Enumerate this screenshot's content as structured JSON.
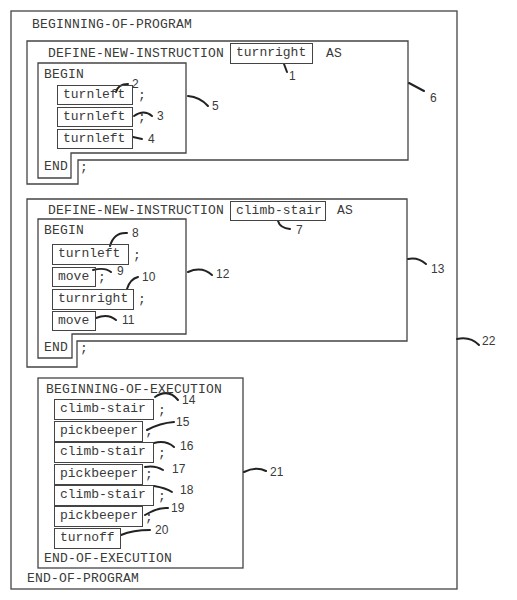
{
  "program": {
    "begin_label": "BEGINNING-OF-PROGRAM",
    "end_label": "END-OF-PROGRAM",
    "ref": "22"
  },
  "instructions": [
    {
      "define_label": "DEFINE-NEW-INSTRUCTION",
      "name": "turnright",
      "as_label": "AS",
      "name_ref": "1",
      "block_ref": "6",
      "body_ref": "5",
      "begin_label": "BEGIN",
      "end_label": "END",
      "end_semicolon": ";",
      "steps": [
        {
          "command": "turnleft",
          "semicolon": ";",
          "ref": "2"
        },
        {
          "command": "turnleft",
          "semicolon": ";",
          "ref": "3"
        },
        {
          "command": "turnleft",
          "semicolon": "",
          "ref": "4"
        }
      ]
    },
    {
      "define_label": "DEFINE-NEW-INSTRUCTION",
      "name": "climb-stair",
      "as_label": "AS",
      "name_ref": "7",
      "block_ref": "13",
      "body_ref": "12",
      "begin_label": "BEGIN",
      "end_label": "END",
      "end_semicolon": ";",
      "steps": [
        {
          "command": "turnleft",
          "semicolon": ";",
          "ref": "8"
        },
        {
          "command": "move",
          "semicolon": ";",
          "ref": "9"
        },
        {
          "command": "turnright",
          "semicolon": ";",
          "ref": "10"
        },
        {
          "command": "move",
          "semicolon": "",
          "ref": "11"
        }
      ]
    }
  ],
  "execution": {
    "begin_label": "BEGINNING-OF-EXECUTION",
    "end_label": "END-OF-EXECUTION",
    "ref": "21",
    "steps": [
      {
        "command": "climb-stair",
        "semicolon": ";",
        "ref": "14"
      },
      {
        "command": "pickbeeper",
        "semicolon": ";",
        "ref": "15"
      },
      {
        "command": "climb-stair",
        "semicolon": ";",
        "ref": "16"
      },
      {
        "command": "pickbeeper",
        "semicolon": ";",
        "ref": "17"
      },
      {
        "command": "climb-stair",
        "semicolon": ";",
        "ref": "18"
      },
      {
        "command": "pickbeeper",
        "semicolon": ";",
        "ref": "19"
      },
      {
        "command": "turnoff",
        "semicolon": "",
        "ref": "20"
      }
    ]
  },
  "colors": {
    "line": "#444444",
    "text": "#3a3a3a",
    "background": "#ffffff"
  }
}
